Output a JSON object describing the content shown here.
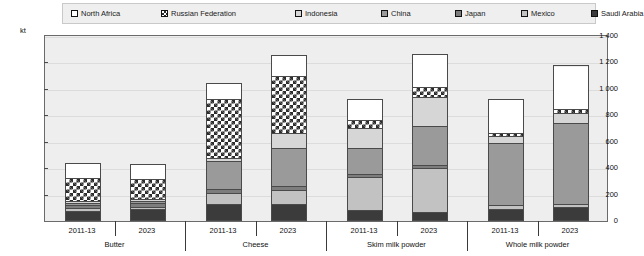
{
  "chart_data": {
    "type": "bar",
    "subtype": "stacked-grouped-column",
    "title": "",
    "xlabel": "",
    "ylabel": "kt",
    "unit": "kt",
    "ylim": [
      0,
      1400
    ],
    "ytick_step": 200,
    "ytick_labels": [
      "1 400",
      "1 200",
      "1 000",
      "800",
      "600",
      "400",
      "200",
      "0"
    ],
    "ytick_values": [
      1400,
      1200,
      1000,
      800,
      600,
      400,
      200,
      0
    ],
    "grid": true,
    "legend_position": "top",
    "legend_entries": [
      {
        "label": "North Africa",
        "key": "north_africa",
        "fill": "white-solid",
        "color": "#ffffff"
      },
      {
        "label": "Russian Federation",
        "key": "russian_federation",
        "fill": "crosshatch-diagonal",
        "color": "#ffffff"
      },
      {
        "label": "Indonesia",
        "key": "indonesia",
        "fill": "light-grey",
        "color": "#d6d6d6"
      },
      {
        "label": "China",
        "key": "china",
        "fill": "mid-grey",
        "color": "#9a9a9a"
      },
      {
        "label": "Japan",
        "key": "japan",
        "fill": "dark-mid-grey",
        "color": "#7d7d7d"
      },
      {
        "label": "Mexico",
        "key": "mexico",
        "fill": "pale-grey",
        "color": "#c2c2c2"
      },
      {
        "label": "Saudi Arabia",
        "key": "saudi_arabia",
        "fill": "near-black",
        "color": "#3b3b3b"
      }
    ],
    "groups": [
      {
        "name": "Butter",
        "periods": [
          {
            "label": "2011-13",
            "total": 424,
            "segments": {
              "saudi_arabia": 62,
              "mexico": 18,
              "japan": 28,
              "china": 14,
              "indonesia": 16,
              "russian_federation": 176,
              "north_africa": 110
            }
          },
          {
            "label": "2023",
            "total": 420,
            "segments": {
              "saudi_arabia": 74,
              "mexico": 16,
              "japan": 30,
              "china": 16,
              "indonesia": 16,
              "russian_federation": 150,
              "north_africa": 118
            }
          }
        ]
      },
      {
        "name": "Cheese",
        "periods": [
          {
            "label": "2011-13",
            "total": 1030,
            "segments": {
              "saudi_arabia": 110,
              "mexico": 90,
              "japan": 28,
              "china": 212,
              "indonesia": 20,
              "russian_federation": 450,
              "north_africa": 120
            }
          },
          {
            "label": "2023",
            "total": 1242,
            "segments": {
              "saudi_arabia": 112,
              "mexico": 108,
              "japan": 30,
              "china": 290,
              "indonesia": 110,
              "russian_federation": 430,
              "north_africa": 162
            }
          }
        ]
      },
      {
        "name": "Skim milk powder",
        "periods": [
          {
            "label": "2011-13",
            "total": 908,
            "segments": {
              "saudi_arabia": 66,
              "mexico": 250,
              "japan": 22,
              "china": 200,
              "indonesia": 150,
              "russian_federation": 60,
              "north_africa": 160
            }
          },
          {
            "label": "2023",
            "total": 1252,
            "segments": {
              "saudi_arabia": 56,
              "mexico": 330,
              "japan": 24,
              "china": 292,
              "indonesia": 222,
              "russian_federation": 72,
              "north_africa": 256
            }
          }
        ]
      },
      {
        "name": "Whole milk powder",
        "periods": [
          {
            "label": "2011-13",
            "total": 906,
            "segments": {
              "saudi_arabia": 78,
              "mexico": 28,
              "japan": 0,
              "china": 470,
              "indonesia": 50,
              "russian_federation": 26,
              "north_africa": 254
            }
          },
          {
            "label": "2023",
            "total": 1162,
            "segments": {
              "saudi_arabia": 94,
              "mexico": 22,
              "japan": 0,
              "china": 614,
              "indonesia": 72,
              "russian_federation": 28,
              "north_africa": 332
            }
          }
        ]
      }
    ]
  }
}
